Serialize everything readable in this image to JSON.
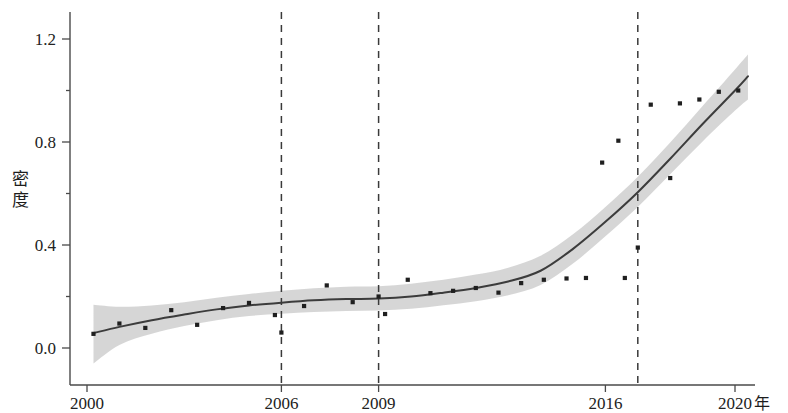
{
  "chart_data": {
    "type": "scatter",
    "title": "",
    "subtitle": "",
    "xlabel": "年",
    "ylabel": "密度",
    "xlim": [
      2000,
      2020.8
    ],
    "ylim": [
      -0.09,
      1.32
    ],
    "grid": false,
    "legend": null,
    "x_ticks": [
      {
        "value": 2000,
        "label": "2000"
      },
      {
        "value": 2006,
        "label": "2006"
      },
      {
        "value": 2009,
        "label": "2009"
      },
      {
        "value": 2016,
        "label": "2016"
      },
      {
        "value": 2020,
        "label": "2020"
      }
    ],
    "y_ticks": [
      {
        "value": 0.0,
        "label": "0.0"
      },
      {
        "value": 0.4,
        "label": "0.4"
      },
      {
        "value": 0.8,
        "label": "0.8"
      },
      {
        "value": 1.2,
        "label": "1.2"
      }
    ],
    "y_minor_ticks": [
      0.2,
      0.6,
      1.0
    ],
    "reference_lines": [
      {
        "x": 2006,
        "style": "dashed"
      },
      {
        "x": 2009,
        "style": "dashed"
      },
      {
        "x": 2017,
        "style": "dashed"
      }
    ],
    "series": [
      {
        "name": "观测点",
        "type": "scatter",
        "marker": "square",
        "color": "#1f1f1f",
        "points": [
          {
            "x": 2000.2,
            "y": 0.055
          },
          {
            "x": 2001.0,
            "y": 0.095
          },
          {
            "x": 2001.8,
            "y": 0.078
          },
          {
            "x": 2002.6,
            "y": 0.147
          },
          {
            "x": 2003.4,
            "y": 0.09
          },
          {
            "x": 2004.2,
            "y": 0.155
          },
          {
            "x": 2005.0,
            "y": 0.175
          },
          {
            "x": 2005.8,
            "y": 0.128
          },
          {
            "x": 2006.0,
            "y": 0.06
          },
          {
            "x": 2006.7,
            "y": 0.163
          },
          {
            "x": 2007.4,
            "y": 0.243
          },
          {
            "x": 2008.2,
            "y": 0.178
          },
          {
            "x": 2009.0,
            "y": 0.2
          },
          {
            "x": 2009.2,
            "y": 0.132
          },
          {
            "x": 2009.9,
            "y": 0.265
          },
          {
            "x": 2010.6,
            "y": 0.213
          },
          {
            "x": 2011.3,
            "y": 0.222
          },
          {
            "x": 2012.0,
            "y": 0.233
          },
          {
            "x": 2012.7,
            "y": 0.215
          },
          {
            "x": 2013.4,
            "y": 0.252
          },
          {
            "x": 2014.1,
            "y": 0.265
          },
          {
            "x": 2014.8,
            "y": 0.27
          },
          {
            "x": 2015.4,
            "y": 0.272
          },
          {
            "x": 2015.9,
            "y": 0.72
          },
          {
            "x": 2016.4,
            "y": 0.805
          },
          {
            "x": 2016.6,
            "y": 0.272
          },
          {
            "x": 2017.0,
            "y": 0.39
          },
          {
            "x": 2017.4,
            "y": 0.945
          },
          {
            "x": 2018.0,
            "y": 0.66
          },
          {
            "x": 2018.3,
            "y": 0.95
          },
          {
            "x": 2018.9,
            "y": 0.965
          },
          {
            "x": 2019.5,
            "y": 0.995
          },
          {
            "x": 2020.1,
            "y": 1.0
          }
        ]
      },
      {
        "name": "拟合曲线",
        "type": "line",
        "color": "#3c3c3c",
        "points": [
          {
            "x": 2000.2,
            "y": 0.058
          },
          {
            "x": 2001.0,
            "y": 0.082
          },
          {
            "x": 2002.0,
            "y": 0.108
          },
          {
            "x": 2003.0,
            "y": 0.13
          },
          {
            "x": 2004.0,
            "y": 0.15
          },
          {
            "x": 2005.0,
            "y": 0.165
          },
          {
            "x": 2006.0,
            "y": 0.176
          },
          {
            "x": 2007.0,
            "y": 0.185
          },
          {
            "x": 2008.0,
            "y": 0.19
          },
          {
            "x": 2009.0,
            "y": 0.192
          },
          {
            "x": 2010.0,
            "y": 0.2
          },
          {
            "x": 2011.0,
            "y": 0.215
          },
          {
            "x": 2012.0,
            "y": 0.233
          },
          {
            "x": 2013.0,
            "y": 0.258
          },
          {
            "x": 2014.0,
            "y": 0.3
          },
          {
            "x": 2015.0,
            "y": 0.385
          },
          {
            "x": 2016.0,
            "y": 0.49
          },
          {
            "x": 2017.0,
            "y": 0.605
          },
          {
            "x": 2018.0,
            "y": 0.735
          },
          {
            "x": 2019.0,
            "y": 0.87
          },
          {
            "x": 2020.0,
            "y": 1.0
          },
          {
            "x": 2020.4,
            "y": 1.055
          }
        ]
      }
    ],
    "confidence_band": {
      "name": "置信区间",
      "color": "#d2d2d2",
      "upper": [
        {
          "x": 2000.2,
          "y": 0.168
        },
        {
          "x": 2001.0,
          "y": 0.16
        },
        {
          "x": 2002.0,
          "y": 0.165
        },
        {
          "x": 2003.0,
          "y": 0.178
        },
        {
          "x": 2004.0,
          "y": 0.195
        },
        {
          "x": 2005.0,
          "y": 0.21
        },
        {
          "x": 2006.0,
          "y": 0.222
        },
        {
          "x": 2007.0,
          "y": 0.232
        },
        {
          "x": 2008.0,
          "y": 0.238
        },
        {
          "x": 2009.0,
          "y": 0.24
        },
        {
          "x": 2010.0,
          "y": 0.25
        },
        {
          "x": 2011.0,
          "y": 0.265
        },
        {
          "x": 2012.0,
          "y": 0.285
        },
        {
          "x": 2013.0,
          "y": 0.312
        },
        {
          "x": 2014.0,
          "y": 0.358
        },
        {
          "x": 2015.0,
          "y": 0.442
        },
        {
          "x": 2016.0,
          "y": 0.548
        },
        {
          "x": 2017.0,
          "y": 0.665
        },
        {
          "x": 2018.0,
          "y": 0.798
        },
        {
          "x": 2019.0,
          "y": 0.94
        },
        {
          "x": 2020.0,
          "y": 1.082
        },
        {
          "x": 2020.4,
          "y": 1.14
        }
      ],
      "lower": [
        {
          "x": 2000.2,
          "y": -0.06
        },
        {
          "x": 2001.0,
          "y": 0.012
        },
        {
          "x": 2002.0,
          "y": 0.055
        },
        {
          "x": 2003.0,
          "y": 0.085
        },
        {
          "x": 2004.0,
          "y": 0.108
        },
        {
          "x": 2005.0,
          "y": 0.124
        },
        {
          "x": 2006.0,
          "y": 0.133
        },
        {
          "x": 2007.0,
          "y": 0.14
        },
        {
          "x": 2008.0,
          "y": 0.144
        },
        {
          "x": 2009.0,
          "y": 0.146
        },
        {
          "x": 2010.0,
          "y": 0.152
        },
        {
          "x": 2011.0,
          "y": 0.166
        },
        {
          "x": 2012.0,
          "y": 0.182
        },
        {
          "x": 2013.0,
          "y": 0.205
        },
        {
          "x": 2014.0,
          "y": 0.245
        },
        {
          "x": 2015.0,
          "y": 0.328
        },
        {
          "x": 2016.0,
          "y": 0.434
        },
        {
          "x": 2017.0,
          "y": 0.548
        },
        {
          "x": 2018.0,
          "y": 0.675
        },
        {
          "x": 2019.0,
          "y": 0.802
        },
        {
          "x": 2020.0,
          "y": 0.922
        },
        {
          "x": 2020.4,
          "y": 0.965
        }
      ]
    }
  },
  "axis": {
    "y_label_chars": [
      "密",
      "度"
    ],
    "x_unit_label": "年"
  }
}
